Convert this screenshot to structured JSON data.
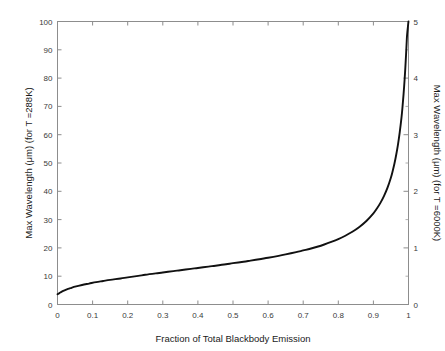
{
  "chart_data": {
    "type": "line",
    "title": "",
    "xlabel": "Fraction of Total Blackbody Emission",
    "ylabel": "Max Wavelength (μm) (for T =288K)",
    "ylabel_right": "Max Wavelength (μm) (for T =6000K)",
    "xlim": [
      0,
      1
    ],
    "ylim": [
      0,
      100
    ],
    "ylim_right": [
      0,
      5
    ],
    "grid": false,
    "legend": null,
    "xticks": [
      0,
      0.1,
      0.2,
      0.3,
      0.4,
      0.5,
      0.6,
      0.7,
      0.8,
      0.9,
      1
    ],
    "xticklabels": [
      "0",
      "0.1",
      "0.2",
      "0.3",
      "0.4",
      "0.5",
      "0.6",
      "0.7",
      "0.8",
      "0.9",
      "1"
    ],
    "yticks": [
      0,
      10,
      20,
      30,
      40,
      50,
      60,
      70,
      80,
      90,
      100
    ],
    "yticklabels": [
      "0",
      "10",
      "20",
      "30",
      "40",
      "50",
      "60",
      "70",
      "80",
      "90",
      "100"
    ],
    "yticks_right": [
      0,
      1,
      2,
      3,
      4,
      5
    ],
    "yticklabels_right": [
      "0",
      "1",
      "2",
      "3",
      "4",
      "5"
    ],
    "yticks_right_minor": [
      0.5,
      1.5,
      2.5,
      3.5,
      4.5
    ],
    "series": [
      {
        "name": "Max Wavelength vs Fraction of Total Blackbody Emission",
        "color": "#111111",
        "x": [
          0,
          0.005,
          0.01,
          0.02,
          0.03,
          0.04,
          0.05,
          0.07,
          0.09,
          0.11,
          0.13,
          0.15,
          0.18,
          0.2,
          0.23,
          0.25,
          0.28,
          0.3,
          0.33,
          0.35,
          0.38,
          0.4,
          0.43,
          0.45,
          0.48,
          0.5,
          0.53,
          0.55,
          0.58,
          0.6,
          0.63,
          0.65,
          0.68,
          0.7,
          0.72,
          0.74,
          0.76,
          0.78,
          0.8,
          0.82,
          0.84,
          0.86,
          0.88,
          0.9,
          0.91,
          0.92,
          0.93,
          0.94,
          0.95,
          0.955,
          0.96,
          0.965,
          0.97,
          0.975,
          0.98,
          0.983,
          0.986,
          0.989,
          0.991,
          0.993,
          0.995,
          0.996,
          0.997,
          0.998,
          0.9985,
          0.999,
          0.9995,
          1.0
        ],
        "y": [
          3.6,
          4.0,
          4.4,
          5.0,
          5.5,
          5.9,
          6.3,
          6.9,
          7.4,
          7.9,
          8.3,
          8.7,
          9.2,
          9.6,
          10.1,
          10.5,
          11.0,
          11.3,
          11.8,
          12.1,
          12.6,
          12.9,
          13.4,
          13.7,
          14.2,
          14.6,
          15.1,
          15.5,
          16.1,
          16.5,
          17.2,
          17.7,
          18.5,
          19.1,
          19.7,
          20.4,
          21.2,
          22.1,
          23.1,
          24.3,
          25.7,
          27.4,
          29.5,
          32.2,
          33.9,
          35.9,
          38.3,
          41.2,
          44.9,
          47.2,
          49.8,
          52.9,
          56.5,
          60.8,
          66.0,
          69.9,
          74.4,
          79.7,
          83.7,
          88.2,
          93.3,
          95.3,
          96.6,
          97.8,
          98.4,
          99.0,
          99.6,
          100.0
        ],
        "y_right_scale_factor": 0.05
      }
    ]
  }
}
